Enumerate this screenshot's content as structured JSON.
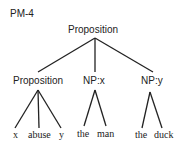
{
  "title": "PM-4",
  "root": "Proposition",
  "children": [
    {
      "label": "Proposition",
      "leaves": [
        "x",
        "abuse",
        "y"
      ]
    },
    {
      "label": "NP:x",
      "leaves": [
        "the",
        "man"
      ]
    },
    {
      "label": "NP:y",
      "leaves": [
        "the",
        "duck"
      ]
    }
  ]
}
